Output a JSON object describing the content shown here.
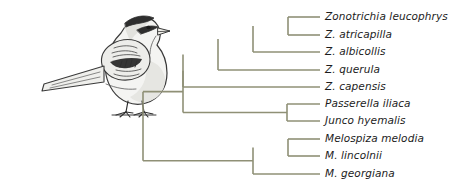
{
  "figure": {
    "kind": "phylogenetic-cladogram",
    "title": "",
    "background_color": "#ffffff",
    "branch_color": "#8f9076",
    "branch_width": 1.6,
    "label_color": "#1c1c1c",
    "illustration": {
      "name": "white-crowned-sparrow-drawing",
      "description": "pencil-style line drawing of a perched sparrow facing right",
      "outline_color": "#3a3a3a",
      "body_fill": "#f2f2f0",
      "shade_fill": "#cfcfcb",
      "dark_fill": "#4a4a4a"
    },
    "tips": [
      {
        "id": "zonotrichia-leucophrys",
        "label": "Zonotrichia leucophrys",
        "y": 17
      },
      {
        "id": "zonotrichia-atricapilla",
        "label": "Z. atricapilla",
        "y": 35
      },
      {
        "id": "zonotrichia-albicollis",
        "label": "Z. albicollis",
        "y": 52
      },
      {
        "id": "zonotrichia-querula",
        "label": "Z. querula",
        "y": 70
      },
      {
        "id": "zonotrichia-capensis",
        "label": "Z. capensis",
        "y": 87
      },
      {
        "id": "passerella-iliaca",
        "label": "Passerella iliaca",
        "y": 104
      },
      {
        "id": "junco-hyemalis",
        "label": "Junco hyemalis",
        "y": 121
      },
      {
        "id": "melospiza-melodia",
        "label": "Melospiza melodia",
        "y": 139
      },
      {
        "id": "melospiza-lincolnii",
        "label": "M. lincolnii",
        "y": 156
      },
      {
        "id": "melospiza-georgiana",
        "label": "M. georgiana",
        "y": 174
      }
    ],
    "label_x": 325,
    "tip_line_end_x": 320,
    "nodes": [
      {
        "id": "root",
        "x": 143,
        "children_y": [
          60,
          165
        ]
      },
      {
        "id": "zonotrichia-passerella-junco",
        "x": 183,
        "children_y": [
          45,
          112
        ]
      },
      {
        "id": "zonotrichia",
        "x": 218,
        "children_y": [
          34,
          87
        ]
      },
      {
        "id": "zonotrichia-core",
        "x": 253,
        "children_y": [
          26,
          70
        ]
      },
      {
        "id": "leucophrys-albicollis",
        "x": 253,
        "children_y": [
          26,
          52
        ]
      },
      {
        "id": "leucophrys-atricapilla",
        "x": 288,
        "children_y": [
          17,
          35
        ]
      },
      {
        "id": "passerella-junco",
        "x": 287,
        "children_y": [
          104,
          121
        ]
      },
      {
        "id": "melospiza",
        "x": 253,
        "children_y": [
          147,
          174
        ]
      },
      {
        "id": "melodia-lincolnii",
        "x": 288,
        "children_y": [
          139,
          156
        ]
      }
    ]
  }
}
